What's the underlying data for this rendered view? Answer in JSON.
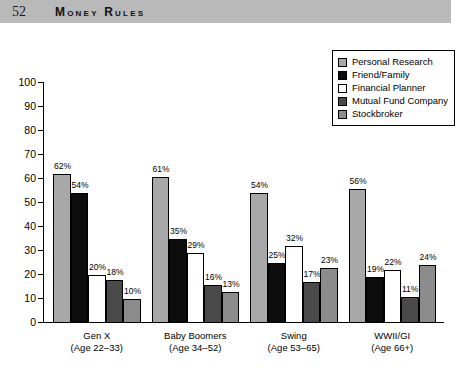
{
  "page": {
    "folio": "52",
    "running_title": "Money Rules"
  },
  "legend": {
    "position": "top-right",
    "items": [
      {
        "label": "Personal Research",
        "color": "#a8a8a8"
      },
      {
        "label": "Friend/Family",
        "color": "#0d0d0d"
      },
      {
        "label": "Financial Planner",
        "color": "#ffffff"
      },
      {
        "label": "Mutual Fund Company",
        "color": "#4a4a4a"
      },
      {
        "label": "Stockbroker",
        "color": "#8c8c8c"
      }
    ]
  },
  "chart_data": {
    "type": "bar",
    "title": "",
    "xlabel": "",
    "ylabel": "",
    "ylim": [
      0,
      100
    ],
    "yticks": [
      0,
      10,
      20,
      30,
      40,
      50,
      60,
      70,
      80,
      90,
      100
    ],
    "grid": false,
    "value_suffix": "%",
    "categories": [
      "Gen X",
      "Baby Boomers",
      "Swing",
      "WWII/GI"
    ],
    "category_sublabels": [
      "(Age 22–33)",
      "(Age 34–52)",
      "(Age 53–65)",
      "(Age 66+)"
    ],
    "series": [
      {
        "name": "Personal Research",
        "color": "#a8a8a8",
        "values": [
          62,
          61,
          54,
          56
        ]
      },
      {
        "name": "Friend/Family",
        "color": "#0d0d0d",
        "values": [
          54,
          35,
          25,
          19
        ]
      },
      {
        "name": "Financial Planner",
        "color": "#ffffff",
        "values": [
          20,
          29,
          32,
          22
        ]
      },
      {
        "name": "Mutual Fund Company",
        "color": "#4a4a4a",
        "values": [
          18,
          16,
          17,
          11
        ]
      },
      {
        "name": "Stockbroker",
        "color": "#8c8c8c",
        "values": [
          10,
          13,
          23,
          24
        ]
      }
    ],
    "bar_labels": [
      [
        "62%",
        "54%",
        "20%",
        "18%",
        "10%"
      ],
      [
        "61%",
        "35%",
        "29%",
        "16%",
        "13%"
      ],
      [
        "54%",
        "25%",
        "32%",
        "17%",
        "23%"
      ],
      [
        "56%",
        "19%",
        "22%",
        "11%",
        "24%"
      ]
    ]
  }
}
